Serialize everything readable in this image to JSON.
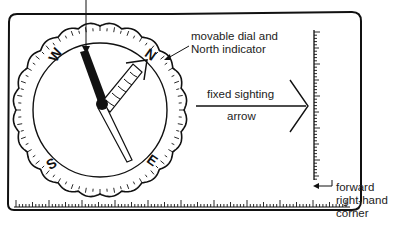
{
  "diagram": {
    "labels": {
      "dial_line1": "movable dial and",
      "dial_line2": "North indicator",
      "sighting_line1": "fixed sighting",
      "sighting_line2": "arrow",
      "corner_line1": "forward",
      "corner_line2": "right-hand",
      "corner_line3": "corner"
    },
    "cardinal_letters": {
      "north": "N",
      "east": "E",
      "south": "S",
      "west": "W"
    }
  }
}
